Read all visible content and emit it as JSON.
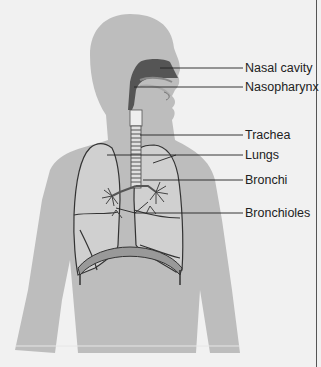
{
  "colors": {
    "background": "#f1f1f1",
    "silhouette": "#bdbdbd",
    "lung_fill": "#d3d3d3",
    "airway_dark": "#555555",
    "outline": "#333333",
    "leader_line": "#222222"
  },
  "labels": [
    {
      "text": "Nasal cavity",
      "y": 68
    },
    {
      "text": "Nasopharynx",
      "y": 87
    },
    {
      "text": "Trachea",
      "y": 135
    },
    {
      "text": "Lungs",
      "y": 157
    },
    {
      "text": "Bronchi",
      "y": 180
    },
    {
      "text": "Bronchioles",
      "y": 215
    }
  ]
}
